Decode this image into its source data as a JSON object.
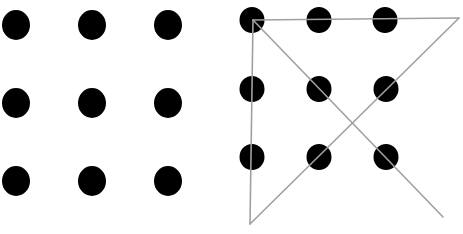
{
  "figure": {
    "background": "#ffffff",
    "dot_color": "#000000",
    "line_color": "#a0a0a0",
    "panels": [
      {
        "name": "puzzle",
        "dots": [
          {
            "cx": 16,
            "cy": 25
          },
          {
            "cx": 92,
            "cy": 25
          },
          {
            "cx": 168,
            "cy": 25
          },
          {
            "cx": 16,
            "cy": 103
          },
          {
            "cx": 92,
            "cy": 103
          },
          {
            "cx": 168,
            "cy": 103
          },
          {
            "cx": 16,
            "cy": 181
          },
          {
            "cx": 92,
            "cy": 181
          },
          {
            "cx": 168,
            "cy": 181
          }
        ],
        "rx": 14,
        "ry": 15
      },
      {
        "name": "solution",
        "dots": [
          {
            "cx": 252,
            "cy": 20
          },
          {
            "cx": 319,
            "cy": 20
          },
          {
            "cx": 385,
            "cy": 20
          },
          {
            "cx": 252,
            "cy": 89
          },
          {
            "cx": 319,
            "cy": 89
          },
          {
            "cx": 386,
            "cy": 89
          },
          {
            "cx": 252,
            "cy": 157
          },
          {
            "cx": 319,
            "cy": 157
          },
          {
            "cx": 386,
            "cy": 157
          }
        ],
        "rx": 12.5,
        "ry": 13,
        "lines": [
          {
            "x1": 253,
            "y1": 20,
            "x2": 459,
            "y2": 18
          },
          {
            "x1": 459,
            "y1": 18,
            "x2": 250,
            "y2": 224
          },
          {
            "x1": 250,
            "y1": 224,
            "x2": 253,
            "y2": 20
          },
          {
            "x1": 253,
            "y1": 20,
            "x2": 443,
            "y2": 217
          }
        ]
      }
    ]
  }
}
